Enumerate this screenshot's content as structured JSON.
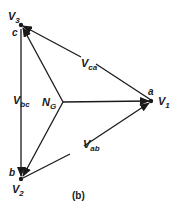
{
  "diagram": {
    "caption": "(b)",
    "nodes": {
      "a": {
        "letter": "a",
        "voltage": "V",
        "sub": "1"
      },
      "b": {
        "letter": "b",
        "voltage": "V",
        "sub": "2"
      },
      "c": {
        "letter": "c",
        "voltage": "V",
        "sub": "3"
      },
      "neutral": {
        "label": "N",
        "sub": "G"
      }
    },
    "line_voltages": {
      "ca": {
        "label": "V",
        "sub": "ca"
      },
      "bc": {
        "label": "V",
        "sub": "bc"
      },
      "ab": {
        "label": "V",
        "sub": "ab"
      }
    },
    "colors": {
      "ink": "#1a1a1a",
      "background": "#ffffff"
    }
  }
}
